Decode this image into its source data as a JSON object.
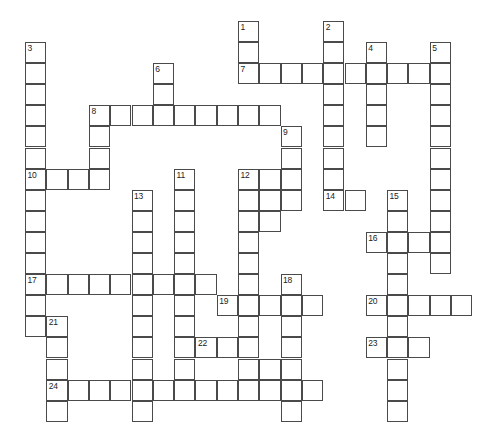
{
  "puzzle": {
    "type": "crossword-grid",
    "title": "Crossword Puzzle Grid",
    "cell_size": 21.3,
    "row_height": 21.1,
    "origin_x": 25,
    "origin_y": 42,
    "columns": 22,
    "rows": 18,
    "grid_line_color": "#4a4a4a",
    "cell_fill_color": "#ffffff",
    "background_color": "#ffffff",
    "number_color": "#222222",
    "entries": [
      {
        "number": "1",
        "direction": "down",
        "col": 10,
        "row": -1,
        "length": 3
      },
      {
        "number": "2",
        "direction": "down",
        "col": 14,
        "row": -1,
        "length": 9
      },
      {
        "number": "3",
        "direction": "down",
        "col": 0,
        "row": 0,
        "length": 13
      },
      {
        "number": "4",
        "direction": "down",
        "col": 16,
        "row": 0,
        "length": 5
      },
      {
        "number": "5",
        "direction": "down",
        "col": 19,
        "row": 0,
        "length": 9
      },
      {
        "number": "6",
        "direction": "down",
        "col": 6,
        "row": 1,
        "length": 3
      },
      {
        "number": "7",
        "direction": "across",
        "col": 10,
        "row": 1,
        "length": 10
      },
      {
        "number": "8",
        "direction": "across",
        "col": 3,
        "row": 3,
        "length": 9
      },
      {
        "number": "8",
        "direction": "down",
        "col": 3,
        "row": 3,
        "length": 3
      },
      {
        "number": "9",
        "direction": "down",
        "col": 12,
        "row": 4,
        "length": 4
      },
      {
        "number": "10",
        "direction": "across",
        "col": 0,
        "row": 6,
        "length": 4
      },
      {
        "number": "11",
        "direction": "down",
        "col": 7,
        "row": 6,
        "length": 10
      },
      {
        "number": "12",
        "direction": "down",
        "col": 10,
        "row": 6,
        "length": 11
      },
      {
        "number": "13",
        "direction": "down",
        "col": 5,
        "row": 7,
        "length": 11
      },
      {
        "number": "14",
        "direction": "across",
        "col": 14,
        "row": 7,
        "length": 2
      },
      {
        "number": "15",
        "direction": "down",
        "col": 17,
        "row": 7,
        "length": 11
      },
      {
        "number": "16",
        "direction": "across",
        "col": 16,
        "row": 9,
        "length": 4
      },
      {
        "number": "17",
        "direction": "across",
        "col": 0,
        "row": 11,
        "length": 9
      },
      {
        "number": "18",
        "direction": "down",
        "col": 12,
        "row": 11,
        "length": 7
      },
      {
        "number": "19",
        "direction": "across",
        "col": 9,
        "row": 12,
        "length": 5
      },
      {
        "number": "20",
        "direction": "across",
        "col": 16,
        "row": 12,
        "length": 5
      },
      {
        "number": "21",
        "direction": "down",
        "col": 1,
        "row": 13,
        "length": 5
      },
      {
        "number": "22",
        "direction": "across",
        "col": 8,
        "row": 14,
        "length": 3
      },
      {
        "number": "23",
        "direction": "across",
        "col": 16,
        "row": 14,
        "length": 3
      },
      {
        "number": "24",
        "direction": "across",
        "col": 1,
        "row": 16,
        "length": 13
      }
    ],
    "cells": [
      [
        10,
        -1
      ],
      [
        10,
        0
      ],
      [
        14,
        -1
      ],
      [
        14,
        0
      ],
      [
        0,
        0
      ],
      [
        0,
        1
      ],
      [
        0,
        2
      ],
      [
        0,
        3
      ],
      [
        0,
        4
      ],
      [
        0,
        5
      ],
      [
        16,
        0
      ],
      [
        19,
        0
      ],
      [
        6,
        1
      ],
      [
        6,
        2
      ],
      [
        10,
        1
      ],
      [
        11,
        1
      ],
      [
        12,
        1
      ],
      [
        13,
        1
      ],
      [
        14,
        1
      ],
      [
        15,
        1
      ],
      [
        16,
        1
      ],
      [
        17,
        1
      ],
      [
        18,
        1
      ],
      [
        19,
        1
      ],
      [
        14,
        2
      ],
      [
        16,
        2
      ],
      [
        19,
        2
      ],
      [
        3,
        3
      ],
      [
        4,
        3
      ],
      [
        5,
        3
      ],
      [
        6,
        3
      ],
      [
        7,
        3
      ],
      [
        8,
        3
      ],
      [
        9,
        3
      ],
      [
        10,
        3
      ],
      [
        11,
        3
      ],
      [
        14,
        3
      ],
      [
        16,
        3
      ],
      [
        19,
        3
      ],
      [
        3,
        4
      ],
      [
        12,
        4
      ],
      [
        14,
        4
      ],
      [
        16,
        4
      ],
      [
        19,
        4
      ],
      [
        0,
        6
      ],
      [
        1,
        6
      ],
      [
        2,
        6
      ],
      [
        3,
        6
      ],
      [
        3,
        5
      ],
      [
        12,
        5
      ],
      [
        14,
        5
      ],
      [
        19,
        5
      ],
      [
        7,
        6
      ],
      [
        10,
        6
      ],
      [
        11,
        6
      ],
      [
        12,
        6
      ],
      [
        14,
        6
      ],
      [
        19,
        6
      ],
      [
        0,
        7
      ],
      [
        5,
        7
      ],
      [
        7,
        7
      ],
      [
        10,
        7
      ],
      [
        11,
        7
      ],
      [
        12,
        7
      ],
      [
        14,
        7
      ],
      [
        15,
        7
      ],
      [
        17,
        7
      ],
      [
        19,
        7
      ],
      [
        0,
        8
      ],
      [
        5,
        8
      ],
      [
        7,
        8
      ],
      [
        10,
        8
      ],
      [
        11,
        8
      ],
      [
        17,
        8
      ],
      [
        19,
        8
      ],
      [
        0,
        9
      ],
      [
        5,
        9
      ],
      [
        7,
        9
      ],
      [
        10,
        9
      ],
      [
        16,
        9
      ],
      [
        17,
        9
      ],
      [
        18,
        9
      ],
      [
        19,
        9
      ],
      [
        0,
        10
      ],
      [
        5,
        10
      ],
      [
        7,
        10
      ],
      [
        10,
        10
      ],
      [
        17,
        10
      ],
      [
        19,
        10
      ],
      [
        0,
        11
      ],
      [
        1,
        11
      ],
      [
        2,
        11
      ],
      [
        3,
        11
      ],
      [
        4,
        11
      ],
      [
        5,
        11
      ],
      [
        6,
        11
      ],
      [
        7,
        11
      ],
      [
        8,
        11
      ],
      [
        10,
        11
      ],
      [
        12,
        11
      ],
      [
        17,
        11
      ],
      [
        0,
        12
      ],
      [
        5,
        12
      ],
      [
        7,
        12
      ],
      [
        9,
        12
      ],
      [
        10,
        12
      ],
      [
        11,
        12
      ],
      [
        12,
        12
      ],
      [
        13,
        12
      ],
      [
        16,
        12
      ],
      [
        17,
        12
      ],
      [
        18,
        12
      ],
      [
        19,
        12
      ],
      [
        20,
        12
      ],
      [
        0,
        13
      ],
      [
        1,
        13
      ],
      [
        5,
        13
      ],
      [
        7,
        13
      ],
      [
        10,
        13
      ],
      [
        12,
        13
      ],
      [
        17,
        13
      ],
      [
        1,
        14
      ],
      [
        5,
        14
      ],
      [
        8,
        14
      ],
      [
        9,
        14
      ],
      [
        10,
        14
      ],
      [
        10,
        14
      ],
      [
        12,
        14
      ],
      [
        16,
        14
      ],
      [
        17,
        14
      ],
      [
        18,
        14
      ],
      [
        1,
        15
      ],
      [
        5,
        15
      ],
      [
        10,
        15
      ],
      [
        11,
        15
      ],
      [
        12,
        15
      ],
      [
        17,
        15
      ],
      [
        1,
        16
      ],
      [
        2,
        16
      ],
      [
        3,
        16
      ],
      [
        4,
        16
      ],
      [
        5,
        16
      ],
      [
        6,
        16
      ],
      [
        7,
        16
      ],
      [
        8,
        16
      ],
      [
        9,
        16
      ],
      [
        10,
        16
      ],
      [
        11,
        16
      ],
      [
        12,
        16
      ],
      [
        13,
        16
      ],
      [
        17,
        16
      ],
      [
        17,
        17
      ]
    ]
  }
}
